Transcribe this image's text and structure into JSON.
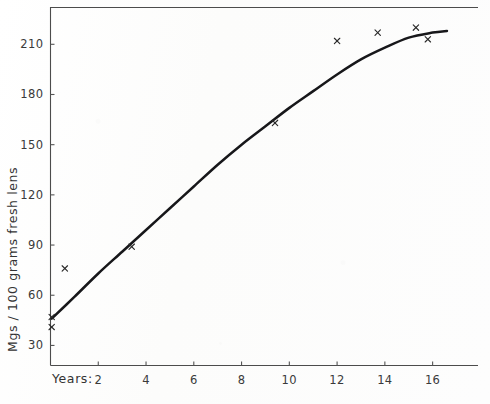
{
  "chart_data": {
    "type": "scatter",
    "title": "",
    "subtitle": "",
    "xlabel": "Years:",
    "ylabel": "Mgs / 100 grams fresh lens",
    "xlim": [
      0,
      17.9
    ],
    "ylim": [
      18,
      232
    ],
    "xticks": [
      2,
      4,
      6,
      8,
      10,
      12,
      14,
      16
    ],
    "yticks": [
      30,
      60,
      90,
      120,
      150,
      180,
      210
    ],
    "xtick_labels": [
      "2",
      "4",
      "6",
      "8",
      "10",
      "12",
      "14",
      "16"
    ],
    "ytick_labels": [
      "30",
      "60",
      "90",
      "120",
      "150",
      "180",
      "210"
    ],
    "grid": false,
    "legend": "none",
    "marker_symbol": "x",
    "series": [
      {
        "name": "observations",
        "marker": "x",
        "points": [
          {
            "x": 0.05,
            "y": 47
          },
          {
            "x": 0.05,
            "y": 41
          },
          {
            "x": 0.6,
            "y": 76
          },
          {
            "x": 3.4,
            "y": 89
          },
          {
            "x": 9.4,
            "y": 163
          },
          {
            "x": 12.0,
            "y": 212
          },
          {
            "x": 13.7,
            "y": 217
          },
          {
            "x": 15.3,
            "y": 220
          },
          {
            "x": 15.8,
            "y": 213
          }
        ]
      },
      {
        "name": "fitted-curve",
        "marker": "none",
        "points": [
          {
            "x": 0.05,
            "y": 46
          },
          {
            "x": 1.0,
            "y": 59
          },
          {
            "x": 2.0,
            "y": 73
          },
          {
            "x": 3.0,
            "y": 86
          },
          {
            "x": 4.0,
            "y": 99
          },
          {
            "x": 5.0,
            "y": 112
          },
          {
            "x": 6.0,
            "y": 125
          },
          {
            "x": 7.0,
            "y": 138
          },
          {
            "x": 8.0,
            "y": 150
          },
          {
            "x": 9.0,
            "y": 161
          },
          {
            "x": 10.0,
            "y": 172
          },
          {
            "x": 11.0,
            "y": 182
          },
          {
            "x": 12.0,
            "y": 192
          },
          {
            "x": 13.0,
            "y": 201
          },
          {
            "x": 14.0,
            "y": 208
          },
          {
            "x": 15.0,
            "y": 214
          },
          {
            "x": 16.0,
            "y": 217
          },
          {
            "x": 16.6,
            "y": 218
          }
        ]
      }
    ],
    "colors": {
      "curve": "#17171a",
      "marker": "#2a2a2a",
      "axis": "#4c4c4c",
      "text": "#3a3a3a",
      "background": "#fdfdfc"
    }
  }
}
